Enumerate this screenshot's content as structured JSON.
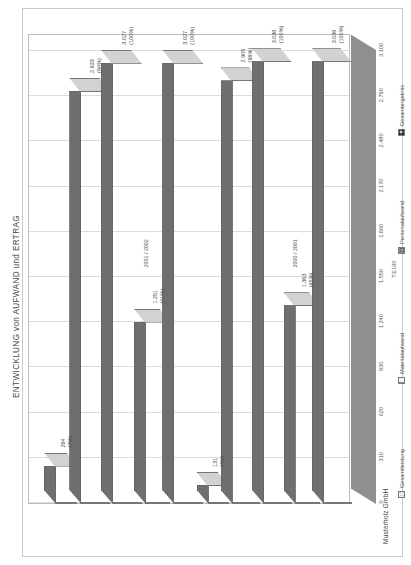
{
  "document": {
    "company": "Musterholz GmbH",
    "title": "ENTWICKLUNG von AUFWAND und ERTRAG"
  },
  "chart_data": {
    "type": "bar",
    "title": "ENTWICKLUNG von AUFWAND und ERTRAG",
    "xlabel": "",
    "ylabel": "TEUR",
    "ylim": [
      0,
      3100
    ],
    "grid": true,
    "legend_position": "bottom",
    "tick_labels": [
      "3.100",
      "2.790",
      "2.480",
      "2.170",
      "1.860",
      "1.550",
      "1.240",
      "930",
      "620",
      "310",
      "0"
    ],
    "tick_values": [
      3100,
      2790,
      2480,
      2170,
      1860,
      1550,
      1240,
      930,
      620,
      310,
      0
    ],
    "categories": [
      "2000 / 2001",
      "2001 / 2002"
    ],
    "series": [
      {
        "name": "Gesamtleistung",
        "pattern": "light",
        "values": [
          3036,
          3027
        ]
      },
      {
        "name": "Materialaufwand",
        "pattern": "vlines",
        "values": [
          1363,
          1251
        ]
      },
      {
        "name": "Personalaufwand",
        "pattern": "dark",
        "values": [
          2905,
          2833
        ]
      },
      {
        "name": "Gesamtergebnis",
        "pattern": "checker",
        "values": [
          131,
          264
        ]
      }
    ],
    "annotations": {
      "group_2000_2001": {
        "label": "2000 / 2001",
        "bars": [
          {
            "series": "Gesamtleistung",
            "value": "3.036",
            "percent": "(100%)"
          },
          {
            "series": "Materialaufwand",
            "value": "1.363",
            "percent": "(45%)"
          },
          {
            "series": "Gesamtleistung2",
            "value": "3.036",
            "percent": "(100%)"
          },
          {
            "series": "Personalaufwand",
            "value": "2.905",
            "percent": "(96%)"
          },
          {
            "series": "Gesamtergebnis",
            "value": "131",
            "percent": "(4%)"
          }
        ]
      },
      "group_2001_2002": {
        "label": "2001 / 2002",
        "bars": [
          {
            "series": "Gesamtleistung",
            "value": "3.027",
            "percent": "(100%)"
          },
          {
            "series": "Materialaufwand",
            "value": "1.251",
            "percent": "(41%)"
          },
          {
            "series": "Gesamtleistung2",
            "value": "3.027",
            "percent": "(100%)"
          },
          {
            "series": "Personalaufwand",
            "value": "2.833",
            "percent": "(94%)"
          },
          {
            "series": "Gesamtergebnis",
            "value": "264",
            "percent": "(7%)"
          }
        ]
      }
    }
  },
  "legend": {
    "items": [
      {
        "label": "Gesamtleistung",
        "color": "#ececec"
      },
      {
        "label": "Materialaufwand",
        "color": "#f3f3f3"
      },
      {
        "label": "Personalaufwand",
        "color": "#8c8c8c"
      },
      {
        "label": "Gesamtergebnis",
        "color": "#cfcfcf"
      }
    ]
  }
}
